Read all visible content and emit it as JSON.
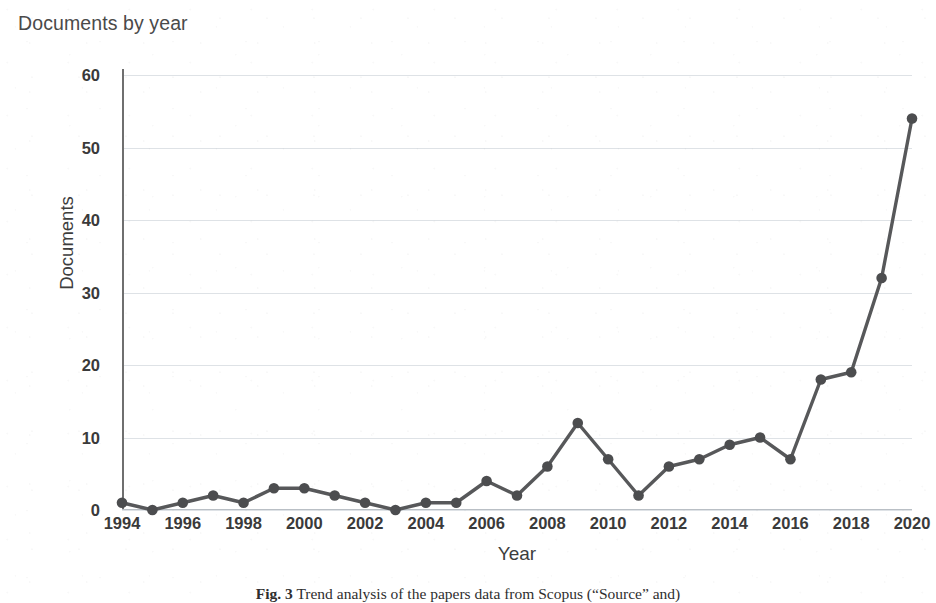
{
  "figure": {
    "chart_title": "Documents by year",
    "caption_label": "Fig. 3",
    "caption_text": "Trend analysis of the papers data from Scopus (“Source” and)"
  },
  "chart_data": {
    "type": "line",
    "title": "Documents by year",
    "xlabel": "Year",
    "ylabel": "Documents",
    "xlim": [
      1994,
      2020
    ],
    "ylim": [
      0,
      60
    ],
    "grid": true,
    "legend": "none",
    "marker": "circle",
    "line_color": "#57585a",
    "marker_color": "#4c4d4f",
    "x": [
      1994,
      1995,
      1996,
      1997,
      1998,
      1999,
      2000,
      2001,
      2002,
      2003,
      2004,
      2005,
      2006,
      2007,
      2008,
      2009,
      2010,
      2011,
      2012,
      2013,
      2014,
      2015,
      2016,
      2017,
      2018,
      2019,
      2020
    ],
    "values": [
      1,
      0,
      1,
      2,
      1,
      3,
      3,
      2,
      1,
      0,
      1,
      1,
      4,
      2,
      6,
      12,
      7,
      2,
      6,
      7,
      9,
      10,
      7,
      18,
      19,
      32,
      54
    ],
    "y_ticks": [
      0,
      10,
      20,
      30,
      40,
      50,
      60
    ],
    "x_ticks": [
      1994,
      1996,
      1998,
      2000,
      2002,
      2004,
      2006,
      2008,
      2010,
      2012,
      2014,
      2016,
      2018,
      2020
    ]
  }
}
